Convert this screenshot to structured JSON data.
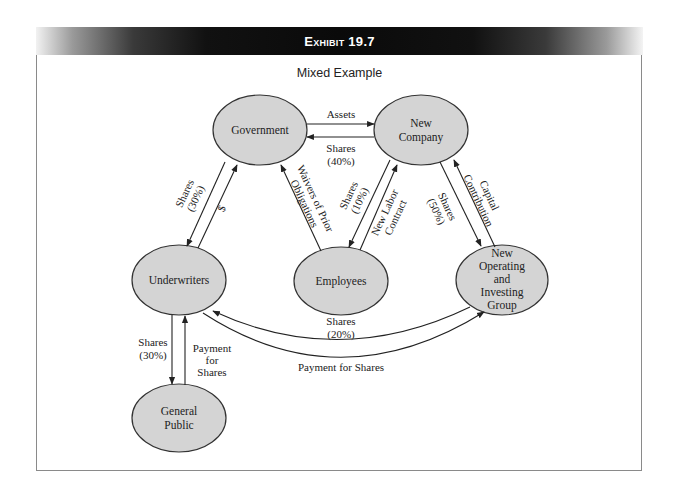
{
  "exhibit": {
    "title": "Exhibit 19.7",
    "subtitle": "Mixed Example"
  },
  "colors": {
    "node_fill": "#d4d4d4",
    "node_stroke": "#333333",
    "edge": "#222222",
    "header_bg": "#0a0a0a",
    "header_text": "#ffffff"
  },
  "nodes": {
    "government": {
      "lines": [
        "Government"
      ]
    },
    "new_company": {
      "lines": [
        "New",
        "Company"
      ]
    },
    "underwriters": {
      "lines": [
        "Underwriters"
      ]
    },
    "employees": {
      "lines": [
        "Employees"
      ]
    },
    "noig": {
      "lines": [
        "New",
        "Operating",
        "and",
        "Investing",
        "Group"
      ]
    },
    "general_public": {
      "lines": [
        "General",
        "Public"
      ]
    }
  },
  "edges": {
    "gov_to_newco": {
      "from": "Government",
      "to": "New Company",
      "lines": [
        "Assets"
      ]
    },
    "newco_to_gov": {
      "from": "New Company",
      "to": "Government",
      "lines": [
        "Shares",
        "(40%)"
      ]
    },
    "gov_to_uw": {
      "from": "Government",
      "to": "Underwriters",
      "lines": [
        "Shares",
        "(30%)"
      ]
    },
    "uw_to_gov": {
      "from": "Underwriters",
      "to": "Government",
      "lines": [
        "$"
      ]
    },
    "emp_to_gov": {
      "from": "Employees",
      "to": "Government",
      "lines": [
        "Waivers of Prior",
        "Obligations"
      ]
    },
    "newco_to_emp": {
      "from": "New Company",
      "to": "Employees",
      "lines": [
        "Shares",
        "(10%)"
      ]
    },
    "emp_to_newco": {
      "from": "Employees",
      "to": "New Company",
      "lines": [
        "New Labor",
        "Contract"
      ]
    },
    "newco_to_noig": {
      "from": "New Company",
      "to": "New Operating and Investing Group",
      "lines": [
        "Shares",
        "(50%)"
      ]
    },
    "noig_to_newco": {
      "from": "New Operating and Investing Group",
      "to": "New Company",
      "lines": [
        "Capital",
        "Contribution"
      ]
    },
    "noig_to_uw": {
      "from": "New Operating and Investing Group",
      "to": "Underwriters",
      "lines": [
        "Shares",
        "(20%)"
      ]
    },
    "uw_to_noig": {
      "from": "Underwriters",
      "to": "New Operating and Investing Group",
      "lines": [
        "Payment for Shares"
      ]
    },
    "uw_to_public": {
      "from": "Underwriters",
      "to": "General Public",
      "lines": [
        "Shares",
        "(30%)"
      ]
    },
    "public_to_uw": {
      "from": "General Public",
      "to": "Underwriters",
      "lines": [
        "Payment",
        "for",
        "Shares"
      ]
    }
  }
}
